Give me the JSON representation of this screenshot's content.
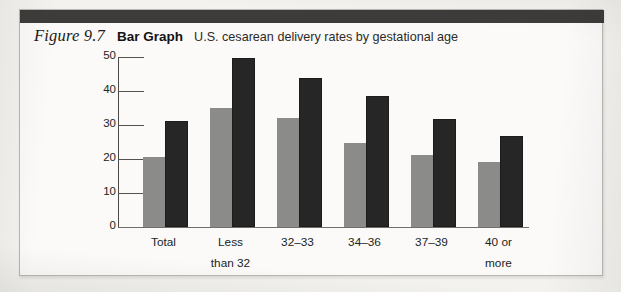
{
  "figure": {
    "number": "Figure 9.7",
    "kind": "Bar Graph",
    "description": "U.S. cesarean delivery rates by gestational age"
  },
  "colors": {
    "series_gray": "#8b8b8a",
    "series_dark": "#262626",
    "header_band": "#3d3c3b",
    "box_border": "#b9b7b2",
    "page_background": "#f3f2ef",
    "figure_background": "#fbfaf8",
    "axis": "#4a4948"
  },
  "chart_data": {
    "type": "bar",
    "title": "U.S. cesarean delivery rates by gestational age",
    "xlabel": "",
    "ylabel": "",
    "ylim": [
      0,
      50
    ],
    "yticks": [
      0,
      10,
      20,
      30,
      40,
      50
    ],
    "ytick_labels": [
      "0",
      "10",
      "20",
      "30",
      "40",
      "50"
    ],
    "grid": false,
    "legend": null,
    "categories": [
      "Total",
      "Less than 32",
      "32–33",
      "34–36",
      "37–39",
      "40 or more"
    ],
    "category_lines": [
      [
        "Total",
        ""
      ],
      [
        "Less",
        "than 32"
      ],
      [
        "32–33",
        ""
      ],
      [
        "34–36",
        ""
      ],
      [
        "37–39",
        ""
      ],
      [
        "40 or",
        "more"
      ]
    ],
    "series": [
      {
        "name": "series-1",
        "color": "#8b8b8a",
        "values": [
          20.0,
          34.5,
          31.5,
          24.0,
          20.7,
          18.5
        ]
      },
      {
        "name": "series-2",
        "color": "#262626",
        "values": [
          30.6,
          49.0,
          43.2,
          38.0,
          31.2,
          26.2
        ]
      }
    ]
  }
}
